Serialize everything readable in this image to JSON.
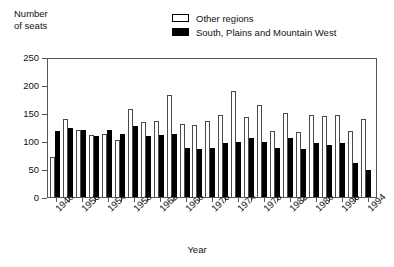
{
  "axis_titles": {
    "y": "Number\nof seats",
    "x": "Year"
  },
  "legend": {
    "position": "top-center",
    "items": [
      {
        "label": "Other regions",
        "style": "open",
        "color": "#ffffff"
      },
      {
        "label": "South, Plains and Mountain West",
        "style": "filled",
        "color": "#000000"
      }
    ]
  },
  "chart_data": {
    "type": "bar",
    "title": "",
    "subtitle": "",
    "xlabel": "Year",
    "ylabel": "Number of seats",
    "ylim": [
      0,
      250
    ],
    "ytick_values": [
      0,
      50,
      100,
      150,
      200,
      250
    ],
    "ytick_labels": [
      "0",
      "50",
      "100",
      "150",
      "200",
      "250"
    ],
    "grid": false,
    "legend_position": "top-center",
    "categories": [
      "1946",
      "1948",
      "1950",
      "1952",
      "1954",
      "1956",
      "1958",
      "1960",
      "1962",
      "1964",
      "1966",
      "1968",
      "1970",
      "1972",
      "1974",
      "1976",
      "1978",
      "1980",
      "1982",
      "1984",
      "1986",
      "1988",
      "1990",
      "1992",
      "1994"
    ],
    "xtick_labels": [
      "1946",
      "1950",
      "1954",
      "1958",
      "1962",
      "1966",
      "1970",
      "1974",
      "1978",
      "1982",
      "1986",
      "1990",
      "1994"
    ],
    "series": [
      {
        "name": "Other regions",
        "style": "open",
        "color": "#ffffff",
        "values": [
          72,
          139,
          120,
          110,
          112,
          101,
          157,
          134,
          136,
          182,
          131,
          128,
          136,
          147,
          190,
          143,
          164,
          117,
          150,
          116,
          147,
          145,
          146,
          118,
          139
        ]
      },
      {
        "name": "South, Plains and Mountain West",
        "style": "filled",
        "color": "#000000",
        "values": [
          117,
          123,
          119,
          109,
          119,
          113,
          126,
          109,
          110,
          113,
          88,
          85,
          87,
          97,
          99,
          105,
          99,
          87,
          105,
          85,
          96,
          92,
          96,
          60,
          49
        ]
      }
    ]
  }
}
